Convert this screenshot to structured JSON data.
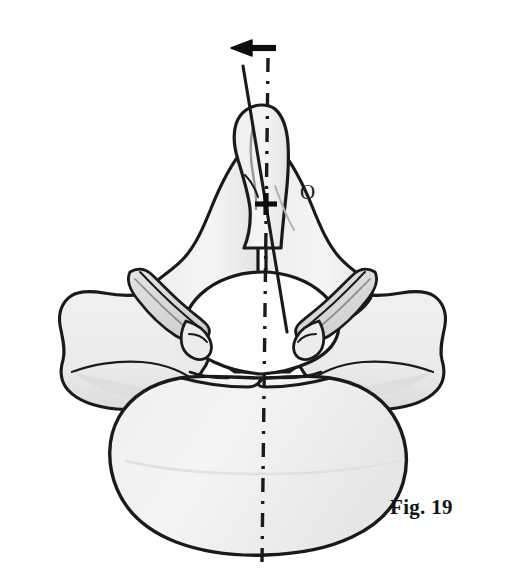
{
  "figure": {
    "caption": "Fig. 19",
    "point_label": "O",
    "background_color": "#ffffff",
    "outline_color": "#1a1a1a",
    "bone_fill_color": "#f2f2f2",
    "shadow_fill_color": "#d9d9d9",
    "foramen_fill_color": "#ffffff"
  },
  "annotations": {
    "rotation_arrow": {
      "name": "rotation-arrow",
      "direction": "left",
      "tip_x": 233,
      "tip_y": 48,
      "tail_x": 276,
      "tail_y": 48
    },
    "midline_axis": {
      "name": "midline-dashed-axis",
      "style": "dash-dot",
      "x_top": 268,
      "y_top": 58,
      "x_bottom": 262,
      "y_bottom": 562
    },
    "deviation_axis": {
      "name": "spinous-process-solid-axis",
      "style": "solid",
      "x_top": 243,
      "y_top": 66,
      "x_bottom": 287,
      "y_bottom": 332
    },
    "center_mark": {
      "name": "center-cross-mark",
      "x": 266,
      "y": 204,
      "arm_length": 11
    }
  },
  "parts": [
    {
      "name": "spinous-process",
      "label": "Spinous process"
    },
    {
      "name": "left-lamina",
      "label": "Left lamina"
    },
    {
      "name": "right-lamina",
      "label": "Right lamina"
    },
    {
      "name": "left-superior-articular-facet",
      "label": "Left superior articular facet"
    },
    {
      "name": "right-superior-articular-facet",
      "label": "Right superior articular facet"
    },
    {
      "name": "left-transverse-process",
      "label": "Left transverse process"
    },
    {
      "name": "right-transverse-process",
      "label": "Right transverse process"
    },
    {
      "name": "vertebral-foramen",
      "label": "Vertebral foramen"
    },
    {
      "name": "vertebral-body",
      "label": "Vertebral body"
    }
  ]
}
